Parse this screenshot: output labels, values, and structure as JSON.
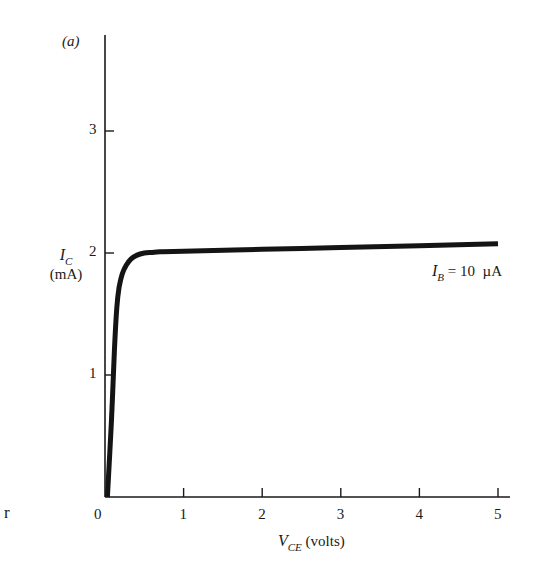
{
  "chart_data": {
    "type": "line",
    "title": "",
    "panel_label": "(a)",
    "xlabel": "V_CE (volts)",
    "ylabel": "I_C (mA)",
    "xlabel_parts": {
      "main": "V",
      "sub": "CE",
      "unit": " (volts)"
    },
    "ylabel_parts": {
      "main": "I",
      "sub": "C",
      "unit": "(mA)"
    },
    "xlim": [
      0,
      5.15
    ],
    "ylim": [
      0,
      3.8
    ],
    "x_ticks": [
      0,
      1,
      2,
      3,
      4,
      5
    ],
    "x_tick_labels": [
      "0",
      "1",
      "2",
      "3",
      "4",
      "5"
    ],
    "y_ticks": [
      1,
      2,
      3
    ],
    "y_tick_labels": [
      "1",
      "2",
      "3"
    ],
    "grid": false,
    "legend": null,
    "series": [
      {
        "name": "I_B = 10 µA",
        "x": [
          0.03,
          0.08,
          0.12,
          0.15,
          0.18,
          0.22,
          0.27,
          0.33,
          0.4,
          0.5,
          0.6,
          0.7,
          1.0,
          2.0,
          3.0,
          4.0,
          5.0
        ],
        "y": [
          0.0,
          0.6,
          1.2,
          1.55,
          1.72,
          1.83,
          1.9,
          1.95,
          1.98,
          2.0,
          2.005,
          2.01,
          2.015,
          2.03,
          2.045,
          2.06,
          2.075
        ]
      }
    ],
    "annotations": [
      {
        "text": "I_B = 10 µA",
        "parts": {
          "main": "I",
          "sub": "B",
          "rest": " = 10  µA"
        },
        "x": 4.0,
        "y": 1.82
      }
    ]
  },
  "margin_text": "r"
}
